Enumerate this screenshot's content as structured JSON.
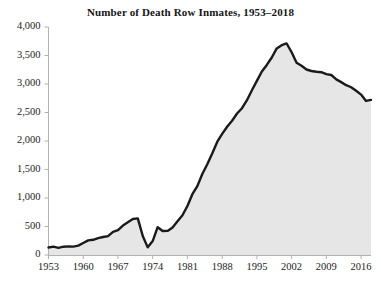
{
  "chart_data": {
    "type": "area",
    "title": "Number of Death Row Inmates, 1953–2018",
    "xlabel": "",
    "ylabel": "",
    "xlim": [
      1953,
      2018
    ],
    "ylim": [
      0,
      4000
    ],
    "grid": false,
    "legend": null,
    "colors": {
      "line": "#1a1a1a",
      "fill": "#e6e6e6",
      "axis": "#b0b0b0",
      "text": "#1a1a1a",
      "background": "#ffffff"
    },
    "ytick_labels": [
      "0",
      "500",
      "1,000",
      "1,500",
      "2,000",
      "2,500",
      "3,000",
      "3,500",
      "4,000"
    ],
    "ytick_values": [
      0,
      500,
      1000,
      1500,
      2000,
      2500,
      3000,
      3500,
      4000
    ],
    "xtick_labels": [
      "1953",
      "1960",
      "1967",
      "1974",
      "1981",
      "1988",
      "1995",
      "2002",
      "2009",
      "2016"
    ],
    "xtick_values": [
      1953,
      1960,
      1967,
      1974,
      1981,
      1988,
      1995,
      2002,
      2009,
      2016
    ],
    "x": [
      1953,
      1954,
      1955,
      1956,
      1957,
      1958,
      1959,
      1960,
      1961,
      1962,
      1963,
      1964,
      1965,
      1966,
      1967,
      1968,
      1969,
      1970,
      1971,
      1972,
      1973,
      1974,
      1975,
      1976,
      1977,
      1978,
      1979,
      1980,
      1981,
      1982,
      1983,
      1984,
      1985,
      1986,
      1987,
      1988,
      1989,
      1990,
      1991,
      1992,
      1993,
      1994,
      1995,
      1996,
      1997,
      1998,
      1999,
      2000,
      2001,
      2002,
      2003,
      2004,
      2005,
      2006,
      2007,
      2008,
      2009,
      2010,
      2011,
      2012,
      2013,
      2014,
      2015,
      2016,
      2017,
      2018
    ],
    "values": [
      131,
      147,
      125,
      146,
      151,
      147,
      164,
      210,
      257,
      267,
      297,
      315,
      331,
      406,
      435,
      517,
      575,
      631,
      642,
      334,
      134,
      244,
      488,
      420,
      423,
      482,
      593,
      697,
      860,
      1066,
      1209,
      1420,
      1591,
      1781,
      1984,
      2124,
      2250,
      2356,
      2482,
      2575,
      2716,
      2890,
      3054,
      3219,
      3335,
      3465,
      3625,
      3682,
      3711,
      3557,
      3374,
      3320,
      3254,
      3228,
      3215,
      3207,
      3173,
      3158,
      3082,
      3033,
      2979,
      2943,
      2881,
      2814,
      2703,
      2721
    ],
    "annotations": []
  }
}
